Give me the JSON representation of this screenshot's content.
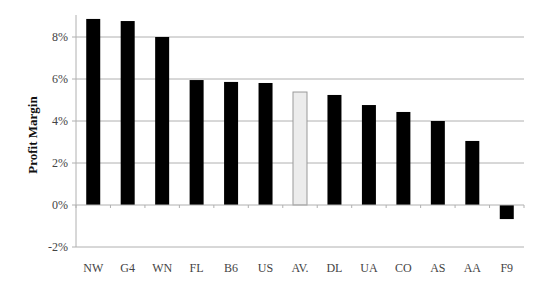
{
  "chart_data": {
    "type": "bar",
    "title": "",
    "xlabel": "",
    "ylabel": "Profit Margin",
    "ylim": [
      -2,
      9
    ],
    "yticks": [
      -2,
      0,
      2,
      4,
      6,
      8
    ],
    "ytick_labels": [
      "-2%",
      "0%",
      "2%",
      "4%",
      "6%",
      "8%"
    ],
    "grid": true,
    "legend": null,
    "categories": [
      "NW",
      "G4",
      "WN",
      "FL",
      "B6",
      "US",
      "AV.",
      "DL",
      "UA",
      "CO",
      "AS",
      "AA",
      "F9"
    ],
    "values": [
      8.86,
      8.76,
      8.0,
      5.95,
      5.86,
      5.81,
      5.38,
      5.24,
      4.76,
      4.43,
      4.0,
      3.05,
      -0.67
    ],
    "highlight_category": "AV.",
    "colors": {
      "bar": "#000000",
      "highlight_bar": "#ececec",
      "highlight_border": "#999999",
      "grid": "#b0b0b0",
      "axis": "#b0b0b0"
    }
  }
}
